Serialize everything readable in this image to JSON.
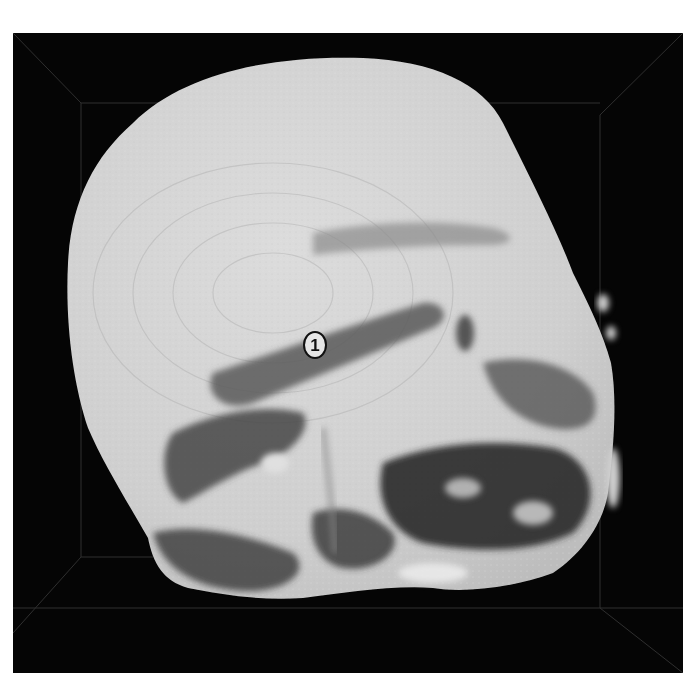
{
  "image": {
    "description": "Grayscale 3D volume rendering of a scanned specimen inside a dark bounding box",
    "background_color": "#050505",
    "surface_color": "#d2d2d2",
    "shadow_color": "#2a2a2a"
  },
  "annotations": [
    {
      "id": "1",
      "text": "1",
      "shape": "circle",
      "position": {
        "x": 314,
        "y": 344
      }
    }
  ]
}
